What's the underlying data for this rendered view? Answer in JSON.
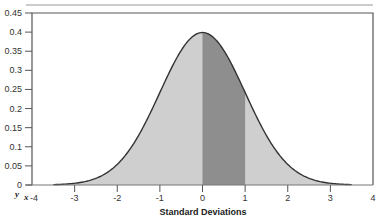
{
  "chart_data": {
    "type": "area",
    "title": "",
    "subtitle": "",
    "xlabel": "Standard Deviations",
    "ylabel": "",
    "corner_labels": {
      "y": "y",
      "x": "x"
    },
    "xlim": [
      -4,
      4
    ],
    "ylim": [
      0,
      0.45
    ],
    "x_ticks": [
      -4,
      -3,
      -2,
      -1,
      0,
      1,
      2,
      3,
      4
    ],
    "x_tick_labels": [
      "-4",
      "-3",
      "-2",
      "-1",
      "0",
      "1",
      "2",
      "3",
      "4"
    ],
    "y_ticks": [
      0,
      0.05,
      0.1,
      0.15,
      0.2,
      0.25,
      0.3,
      0.35,
      0.4,
      0.45
    ],
    "y_tick_labels": [
      "0",
      "0.05",
      "0.1",
      "0.15",
      "0.2",
      "0.25",
      "0.3",
      "0.35",
      "0.4",
      "0.45"
    ],
    "grid": false,
    "legend": "none",
    "series": [
      {
        "name": "Standard normal density",
        "distribution": "normal",
        "mean": 0,
        "sd": 1,
        "x_range": [
          -3.5,
          3.5
        ],
        "x": [
          -3.5,
          -3,
          -2.5,
          -2,
          -1.5,
          -1,
          -0.5,
          0,
          0.5,
          1,
          1.5,
          2,
          2.5,
          3,
          3.5
        ],
        "values": [
          0.0009,
          0.0044,
          0.0175,
          0.054,
          0.1295,
          0.242,
          0.3521,
          0.3989,
          0.3521,
          0.242,
          0.1295,
          0.054,
          0.0175,
          0.0044,
          0.0009
        ]
      }
    ],
    "shaded_regions": [
      {
        "name": "full-area",
        "from": -3.5,
        "to": 3.5,
        "color": "#cfcfcf"
      },
      {
        "name": "zero-to-one-sd",
        "from": 0,
        "to": 1,
        "color": "#8e8e8e"
      }
    ],
    "colors": {
      "curve": "#333333",
      "axis": "#555555",
      "frame": "#555555"
    }
  }
}
